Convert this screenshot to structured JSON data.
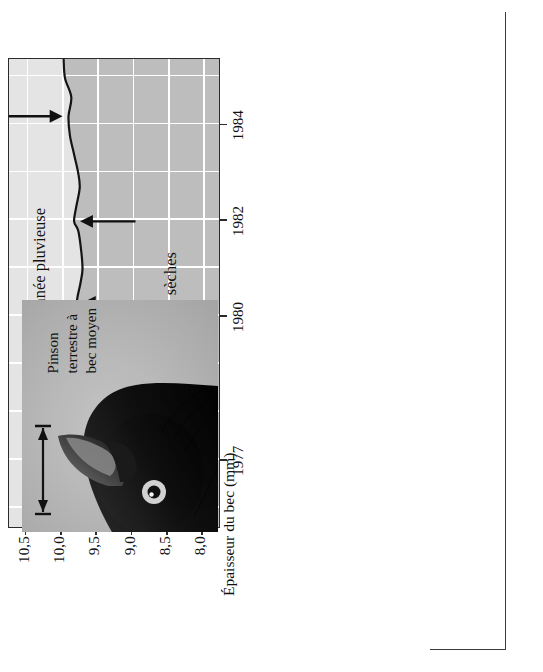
{
  "figure": {
    "orientation": "rotated-90-ccw",
    "species_photo": {
      "caption_lines": [
        "Pinson",
        "terrestre à",
        "bec moyen"
      ],
      "measure_label": "beak-depth-measure-arrow"
    }
  },
  "chart_data": {
    "type": "line",
    "title": "",
    "xlabel": "",
    "ylabel": "Épaisseur du bec (mm)",
    "xlim": [
      1975.6,
      1985.4
    ],
    "ylim": [
      7.75,
      10.75
    ],
    "xticks": [
      1977,
      1980,
      1982,
      1984
    ],
    "xtick_labels": [
      "1977",
      "1980",
      "1982",
      "1984"
    ],
    "yticks": [
      8.0,
      8.5,
      9.0,
      9.5,
      10.0,
      10.5
    ],
    "ytick_labels": [
      "8,0",
      "8,5",
      "9,0",
      "9,5",
      "10,0",
      "10,5"
    ],
    "grid": true,
    "legend": "none",
    "series": [
      {
        "name": "Épaisseur moyenne du bec",
        "x": [
          1975.6,
          1976.0,
          1976.4,
          1976.8,
          1977.0,
          1977.3,
          1977.7,
          1978.1,
          1978.5,
          1979.0,
          1979.5,
          1980.0,
          1980.3,
          1980.7,
          1981.0,
          1981.4,
          1981.8,
          1982.0,
          1982.3,
          1982.7,
          1983.0,
          1983.4,
          1983.8,
          1984.2,
          1984.6,
          1985.0,
          1985.4
        ],
        "values": [
          9.42,
          9.45,
          9.5,
          9.57,
          9.62,
          9.6,
          9.63,
          9.66,
          9.68,
          9.7,
          9.69,
          9.72,
          9.78,
          9.73,
          9.7,
          9.72,
          9.76,
          9.82,
          9.79,
          9.74,
          9.76,
          9.82,
          9.88,
          9.9,
          9.86,
          9.95,
          9.97
        ]
      }
    ],
    "annotations": [
      {
        "text": "Années sèches",
        "role": "dry-years-label",
        "x": 1980.4,
        "y": 8.45,
        "arrow": "left"
      },
      {
        "text": "Année pluvieuse",
        "role": "rainy-year-label",
        "x": 1981.2,
        "y": 10.3,
        "arrow": "right"
      }
    ],
    "arrow_markers": [
      {
        "name": "arrow-1977",
        "x": 1977.0,
        "direction": "left"
      },
      {
        "name": "arrow-1980",
        "x": 1980.3,
        "direction": "left"
      },
      {
        "name": "arrow-1982",
        "x": 1982.0,
        "direction": "left"
      },
      {
        "name": "arrow-1984",
        "x": 1984.2,
        "direction": "right"
      }
    ],
    "regions": [
      {
        "name": "upper-light-band",
        "color": "#e4e4e4"
      },
      {
        "name": "lower-dark-band",
        "color": "#bdbdbd"
      }
    ]
  },
  "colors": {
    "band_light": "#e4e4e4",
    "band_dark": "#bdbdbd",
    "grid": "#ffffff",
    "ink": "#2b2b2b",
    "photo_bg": "#b9b9b9"
  }
}
